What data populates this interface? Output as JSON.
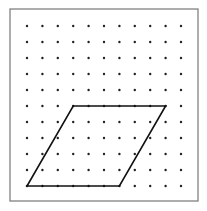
{
  "diagram": {
    "type": "dot-grid-with-parallelogram",
    "frame": {
      "x": 10,
      "y": 9,
      "width": 188,
      "height": 192,
      "stroke": "#777777"
    },
    "grid": {
      "columns": 11,
      "rows": 11,
      "origin_x": 27,
      "origin_y": 26,
      "spacing_x": 15.4,
      "spacing_y": 16,
      "dot_radius": 1.2,
      "dot_color": "#222222"
    },
    "shape": {
      "name": "parallelogram",
      "stroke": "#111111",
      "stroke_width": 1.6,
      "vertices_grid": [
        [
          3,
          5
        ],
        [
          9,
          5
        ],
        [
          6,
          10
        ],
        [
          0,
          10
        ]
      ]
    }
  }
}
